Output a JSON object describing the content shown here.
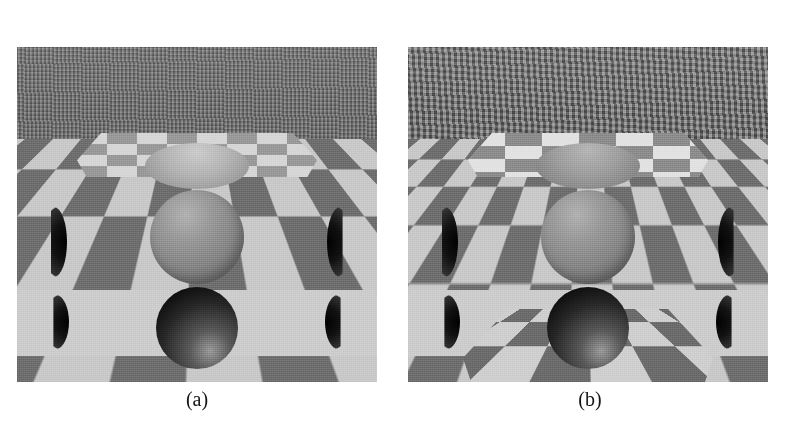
{
  "figure": {
    "background_color": "#ffffff",
    "panel_count": 2,
    "panels": [
      {
        "id": "a",
        "caption": "(a)",
        "scene_description": "Perspective view of an infinite checkerboard environment with a floating gray sphere, a dark sphere set into a light lower surface, and a checkered ceiling plane receding to the horizon; the lower surface is diffuse with no visible reflection.",
        "features": [
          "far checkerboard ceiling with aliasing near horizon",
          "light ceiling patch with bright reflected sphere",
          "central floating gray sphere",
          "light lower shelf surface",
          "dark sphere inset in lower surface",
          "dark crescent cut spheres at left and right edges"
        ]
      },
      {
        "id": "b",
        "caption": "(b)",
        "scene_description": "Same perspective checkerboard scene rendered with sharper texture filtering; the lower surface is reflective and mirrors the checkerboard and the dark sphere, and the ceiling patch checkers are crisp and high contrast.",
        "features": [
          "far checkerboard ceiling with aliasing near horizon",
          "sharp high-contrast checkered ceiling patch",
          "central floating gray sphere",
          "reflective lower shelf showing mirrored checkerboard",
          "dark sphere inset in lower surface with reflection",
          "dark crescent cut spheres at left and right edges"
        ]
      }
    ]
  },
  "palette": {
    "page_background": "#ffffff",
    "checker_light": "#c9c9c9",
    "checker_dark": "#6f6f6f",
    "sphere_mid_gray": "#8a8a8a",
    "sphere_dark": "#0d0d0d",
    "shelf_light": "#cdcdcd",
    "caption_text": "#141414"
  }
}
